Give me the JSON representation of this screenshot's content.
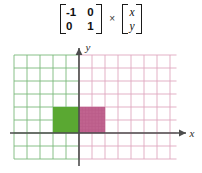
{
  "equation": {
    "matrix": {
      "rows": [
        [
          "-1",
          "0"
        ],
        [
          "0",
          "1"
        ]
      ]
    },
    "operator": "×",
    "vector": {
      "rows": [
        "x",
        "y"
      ]
    }
  },
  "plot": {
    "axis_x_label": "x",
    "axis_y_label": "y",
    "colors": {
      "grid_left": "#7cb97c",
      "grid_right": "#e0a8c0",
      "axis": "#4d4d4d",
      "shape_preimage_fill": "#5aa832",
      "shape_image_fill": "#c0638f",
      "shape_image_stroke": "#b0517f"
    },
    "grid": {
      "cell_px": 13,
      "cols_left_of_y_axis": 5,
      "cols_right_of_y_axis": 7.5,
      "rows_above_x_axis": 6,
      "rows_below_x_axis": 2
    },
    "shapes": [
      {
        "name": "preimage-rectangle",
        "fill": "#5aa832",
        "x_cells": [
          -2,
          0
        ],
        "y_cells": [
          0,
          2
        ]
      },
      {
        "name": "image-rectangle",
        "fill": "#c0638f",
        "x_cells": [
          0,
          2
        ],
        "y_cells": [
          0,
          2
        ]
      }
    ]
  }
}
